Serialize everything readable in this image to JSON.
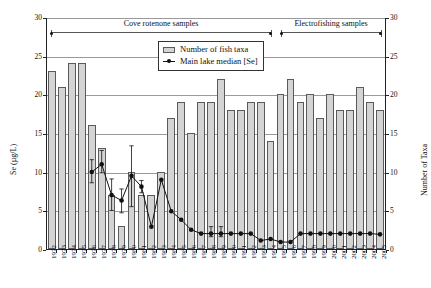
{
  "chart_data": {
    "type": "bar",
    "title": "",
    "xlabel": "",
    "ylabel": "Se (µg/L)",
    "y2label": "Number of Taxa",
    "ylim": [
      0,
      30
    ],
    "y2lim": [
      0,
      30
    ],
    "yticks": [
      0,
      5,
      10,
      15,
      20,
      25,
      30
    ],
    "y2ticks": [
      0,
      5,
      10,
      15,
      20,
      25,
      30
    ],
    "grid": true,
    "legend_position": "upper-center",
    "categories": [
      "1972",
      "1973",
      "1974",
      "1975",
      "1976",
      "1977",
      "1978",
      "1979",
      "1980",
      "1981",
      "1982",
      "1983",
      "1984",
      "1985",
      "1986",
      "1987",
      "1988",
      "1989",
      "1990",
      "1991",
      "1992",
      "1993",
      "1994",
      "1995",
      "1996",
      "1997",
      "1998",
      "1999",
      "2000",
      "2001",
      "2002",
      "2003",
      "2004",
      "2005"
    ],
    "series": [
      {
        "name": "Number of fish taxa",
        "kind": "bar",
        "axis": "right",
        "color": "#d4d4d4",
        "edge_color": "#5a5a5a",
        "values": [
          23,
          21,
          24,
          24,
          16,
          13,
          7,
          3,
          10,
          7,
          7,
          10,
          17,
          19,
          15,
          19,
          19,
          22,
          18,
          18,
          19,
          19,
          14,
          20,
          22,
          19,
          20,
          17,
          20,
          18,
          18,
          21,
          19,
          18
        ]
      },
      {
        "name": "Main lake median [Se]",
        "kind": "line-marker",
        "axis": "left",
        "color": "#111111",
        "values": [
          null,
          null,
          null,
          null,
          10.0,
          11.0,
          7.0,
          6.3,
          9.5,
          8.1,
          2.9,
          9.0,
          4.9,
          3.8,
          2.5,
          2.0,
          2.0,
          2.0,
          2.0,
          2.0,
          2.0,
          1.1,
          1.3,
          0.9,
          0.9,
          2.0,
          2.0,
          2.0,
          2.0,
          2.0,
          2.0,
          2.0,
          2.0,
          1.9
        ],
        "error_low": [
          null,
          null,
          null,
          null,
          8.6,
          9.9,
          5.0,
          4.7,
          5.5,
          7.3,
          null,
          null,
          null,
          null,
          null,
          null,
          1.6,
          1.6,
          null,
          null,
          null,
          null,
          null,
          null,
          null,
          null,
          null,
          null,
          null,
          null,
          null,
          null,
          null,
          null
        ],
        "error_high": [
          null,
          null,
          null,
          null,
          11.6,
          12.8,
          9.1,
          7.8,
          13.4,
          8.9,
          null,
          null,
          null,
          null,
          null,
          null,
          2.9,
          2.9,
          null,
          null,
          null,
          null,
          null,
          null,
          null,
          null,
          null,
          null,
          null,
          null,
          null,
          null,
          null,
          null
        ]
      }
    ],
    "annotations": [
      {
        "label": "Cove rotenone samples",
        "start_category": "1972",
        "end_category": "1994",
        "y": 28.2
      },
      {
        "label": "Electrofishing samples",
        "start_category": "1995",
        "end_category": "2005",
        "y": 28.2
      }
    ]
  },
  "legend": {
    "items": [
      {
        "label": "Number of fish taxa",
        "marker": "bar-swatch"
      },
      {
        "label": "Main lake median [Se]",
        "marker": "line-dot"
      }
    ]
  },
  "axes": {
    "left_title": "Se (µg/L)",
    "right_title": "Number of Taxa"
  }
}
